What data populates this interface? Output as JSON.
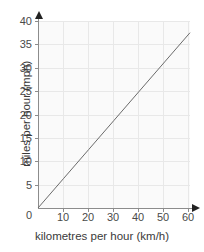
{
  "chart_data": {
    "type": "line",
    "title": "",
    "xlabel": "kilometres per hour (km/h)",
    "ylabel": "miles per hour (mph)",
    "xlim": [
      0,
      60
    ],
    "ylim": [
      0,
      40
    ],
    "xticks": [
      0,
      10,
      20,
      30,
      40,
      50,
      60
    ],
    "yticks": [
      0,
      5,
      10,
      15,
      20,
      25,
      30,
      35,
      40
    ],
    "xtick_labels": [
      "0",
      "10",
      "20",
      "30",
      "40",
      "50",
      "60"
    ],
    "ytick_labels": [
      "0",
      "5",
      "10",
      "15",
      "20",
      "25",
      "30",
      "35",
      "40"
    ],
    "grid": true,
    "legend": null,
    "legend_position": "none",
    "series": [
      {
        "name": "km/h to mph conversion",
        "x": [
          0,
          10,
          20,
          30,
          40,
          50,
          60
        ],
        "values": [
          0,
          6.25,
          12.5,
          18.75,
          25,
          31.25,
          37.5
        ],
        "color": "#6b6b6b",
        "style": "solid"
      }
    ],
    "annotations": []
  },
  "colors": {
    "plot_background": "#fafafa",
    "gridline_major": "#e8e8e8",
    "gridline_minor": "#f1f1f1",
    "axis": "#8c8c8c",
    "arrowhead": "#222222",
    "line": "#6b6b6b",
    "text": "#3a3a3a",
    "page_background": "#ffffff"
  }
}
